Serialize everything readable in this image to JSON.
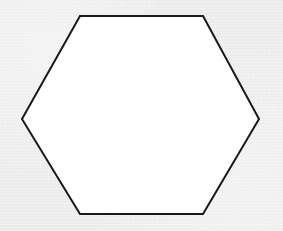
{
  "canvas": {
    "width": 283,
    "height": 231,
    "background_color": "#ededed",
    "texture": "paper-grain"
  },
  "figure": {
    "name": "hexagon",
    "shape_type": "regular-hexagon",
    "orientation": "flat-top",
    "sides": 6,
    "fill_color": "#ffffff",
    "stroke_color": "#1a1a1a",
    "stroke_width": 2,
    "vertices": [
      {
        "label": "top-left",
        "x": 80,
        "y": 16
      },
      {
        "label": "top-right",
        "x": 203,
        "y": 16
      },
      {
        "label": "right",
        "x": 259,
        "y": 119
      },
      {
        "label": "bottom-right",
        "x": 203,
        "y": 214
      },
      {
        "label": "bottom-left",
        "x": 80,
        "y": 214
      },
      {
        "label": "left",
        "x": 22,
        "y": 119
      }
    ],
    "bounding_box": {
      "x": 22,
      "y": 16,
      "width": 237,
      "height": 198
    },
    "center": {
      "x": 140,
      "y": 115
    }
  }
}
